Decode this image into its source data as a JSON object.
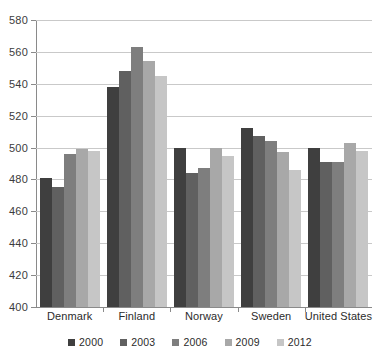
{
  "chart_data": {
    "type": "bar",
    "title": "",
    "subtitle": "",
    "xlabel": "",
    "ylabel": "",
    "ylim": [
      400,
      580
    ],
    "ytick_step": 20,
    "yticks": [
      580,
      560,
      540,
      520,
      500,
      480,
      460,
      440,
      420,
      400
    ],
    "grid": true,
    "legend_position": "bottom",
    "categories": [
      "Denmark",
      "Finland",
      "Norway",
      "Sweden",
      "United States"
    ],
    "series": [
      {
        "name": "2000",
        "color": "#3f3f3f",
        "values": [
          481,
          538,
          500,
          512,
          500
        ]
      },
      {
        "name": "2003",
        "color": "#606060",
        "values": [
          475,
          548,
          484,
          507,
          491
        ]
      },
      {
        "name": "2006",
        "color": "#7e7e7e",
        "values": [
          496,
          563,
          487,
          504,
          491
        ]
      },
      {
        "name": "2009",
        "color": "#a8a8a8",
        "values": [
          499,
          554,
          500,
          497,
          503
        ]
      },
      {
        "name": "2012",
        "color": "#c6c6c6",
        "values": [
          498,
          545,
          495,
          486,
          498
        ]
      }
    ]
  },
  "axis": {
    "line_color": "#8a8a8a",
    "grid_color": "#c9c9c9"
  },
  "background_color": "#ffffff"
}
